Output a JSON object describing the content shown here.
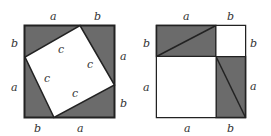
{
  "colors": {
    "shade": "#6b6b6b",
    "stroke": "#222222",
    "background": "#ffffff"
  },
  "left_figure": {
    "top_labels": [
      "a",
      "b"
    ],
    "bottom_labels": [
      "b",
      "a"
    ],
    "left_labels": [
      "b",
      "a"
    ],
    "right_labels": [
      "a",
      "b"
    ],
    "inner_labels": [
      "c",
      "c",
      "c",
      "c"
    ]
  },
  "right_figure": {
    "top_labels": [
      "a",
      "b"
    ],
    "bottom_labels": [
      "a",
      "b"
    ],
    "left_labels": [
      "b",
      "a"
    ],
    "right_labels": [
      "b",
      "a"
    ]
  }
}
